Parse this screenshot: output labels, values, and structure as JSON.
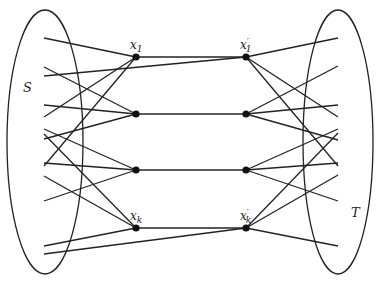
{
  "diagram": {
    "type": "bipartite-matching-graph",
    "stroke_color": "#222222",
    "sets": [
      {
        "id": "S",
        "label": "S",
        "cx": 45,
        "cy": 142,
        "rx": 38,
        "ry": 132,
        "label_x": 23,
        "label_y": 92
      },
      {
        "id": "T",
        "label": "T",
        "cx": 338,
        "cy": 142,
        "rx": 35,
        "ry": 132,
        "label_x": 351,
        "label_y": 217
      }
    ],
    "nodes": [
      {
        "id": "x1",
        "label": "x",
        "sub": "1",
        "prime": false,
        "x": 136,
        "y": 57,
        "label_pos": "above"
      },
      {
        "id": "x2",
        "label": "",
        "sub": "",
        "prime": false,
        "x": 136,
        "y": 114
      },
      {
        "id": "x3",
        "label": "",
        "sub": "",
        "prime": false,
        "x": 136,
        "y": 170
      },
      {
        "id": "xk",
        "label": "x",
        "sub": "k",
        "prime": false,
        "x": 136,
        "y": 228,
        "label_pos": "above"
      },
      {
        "id": "x1p",
        "label": "x",
        "sub": "1",
        "prime": true,
        "x": 246,
        "y": 57,
        "label_pos": "above"
      },
      {
        "id": "x2p",
        "label": "",
        "sub": "",
        "prime": true,
        "x": 246,
        "y": 114
      },
      {
        "id": "x3p",
        "label": "",
        "sub": "",
        "prime": true,
        "x": 246,
        "y": 170
      },
      {
        "id": "xkp",
        "label": "x",
        "sub": "k",
        "prime": true,
        "x": 246,
        "y": 228,
        "label_pos": "above"
      }
    ],
    "matching_edges": [
      [
        "x1",
        "x1p"
      ],
      [
        "x2",
        "x2p"
      ],
      [
        "x3",
        "x3p"
      ],
      [
        "xk",
        "xkp"
      ]
    ],
    "left_edges": [
      {
        "from_y": 38,
        "to": "x1"
      },
      {
        "from_y": 117,
        "to": "x1"
      },
      {
        "from_y": 166,
        "to": "x1"
      },
      {
        "from_y": 67,
        "to": "x2"
      },
      {
        "from_y": 105,
        "to": "x2"
      },
      {
        "from_y": 139,
        "to": "x2"
      },
      {
        "from_y": 129,
        "to": "x3"
      },
      {
        "from_y": 163,
        "to": "x3"
      },
      {
        "from_y": 201,
        "to": "x3"
      },
      {
        "from_y": 134,
        "to": "xk"
      },
      {
        "from_y": 176,
        "to": "xk"
      },
      {
        "from_y": 246,
        "to": "xk"
      },
      {
        "from_y": 76,
        "to": "x1p"
      },
      {
        "from_y": 254,
        "to": "xkp"
      }
    ],
    "right_edges": [
      {
        "from": "x1p",
        "to_y": 38
      },
      {
        "from": "x1p",
        "to_y": 117
      },
      {
        "from": "x1p",
        "to_y": 166
      },
      {
        "from": "x2p",
        "to_y": 66
      },
      {
        "from": "x2p",
        "to_y": 105
      },
      {
        "from": "x2p",
        "to_y": 140
      },
      {
        "from": "x3p",
        "to_y": 129
      },
      {
        "from": "x3p",
        "to_y": 163
      },
      {
        "from": "x3p",
        "to_y": 201
      },
      {
        "from": "xkp",
        "to_y": 133
      },
      {
        "from": "xkp",
        "to_y": 175
      },
      {
        "from": "xkp",
        "to_y": 246
      }
    ],
    "left_x": 44,
    "right_x": 338
  }
}
